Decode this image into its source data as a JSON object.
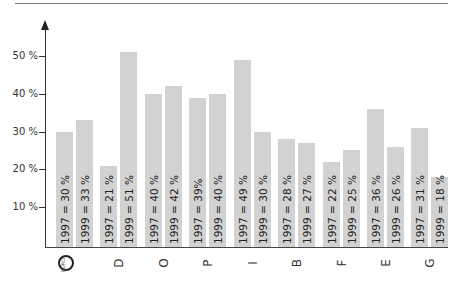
{
  "chart_data": {
    "type": "bar",
    "title": "",
    "xlabel": "",
    "ylabel": "",
    "ylim": [
      0,
      55
    ],
    "grid": false,
    "legend": null,
    "yticks": [
      "10 %",
      "20 %",
      "30 %",
      "40 %",
      "50 %"
    ],
    "categories": [
      "EU",
      "D",
      "O",
      "P",
      "I",
      "B",
      "F",
      "E",
      "G"
    ],
    "series": [
      {
        "name": "1997",
        "values": [
          30,
          21,
          40,
          39,
          49,
          28,
          22,
          36,
          31
        ]
      },
      {
        "name": "1999",
        "values": [
          33,
          51,
          42,
          40,
          30,
          27,
          25,
          26,
          18
        ]
      }
    ],
    "bar_labels": [
      [
        "1997 = 30 %",
        "1999 = 33 %"
      ],
      [
        "1997 = 21 %",
        "1999 = 51 %"
      ],
      [
        "1997 = 40 %",
        "1999 = 42 %"
      ],
      [
        "1997 = 39%",
        "1999 = 40 %"
      ],
      [
        "1997 = 49 %",
        "1999 = 30 %"
      ],
      [
        "1997 = 28 %",
        "1999 = 27 %"
      ],
      [
        "1997 = 22 %",
        "1999 = 25 %"
      ],
      [
        "1997 = 36 %",
        "1999 = 26 %"
      ],
      [
        "1997 = 31 %",
        "1999 = 18 %"
      ]
    ]
  },
  "colors": {
    "bar": "#d2d2d2",
    "axis": "#333333"
  },
  "eu_icon_text": "EURO"
}
